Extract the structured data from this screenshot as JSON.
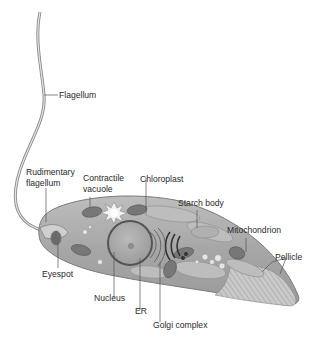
{
  "diagram": {
    "labels": {
      "flagellum": "Flagellum",
      "rudimentary_flagellum_1": "Rudimentary",
      "rudimentary_flagellum_2": "flagellum",
      "contractile_vacuole_1": "Contractile",
      "contractile_vacuole_2": "vacuole",
      "chloroplast": "Chloroplast",
      "starch_body": "Starch body",
      "mitochondrion": "Mitochondrion",
      "pellicle": "Pellicle",
      "eyespot": "Eyespot",
      "nucleus": "Nucleus",
      "er": "ER",
      "golgi_complex": "Golgi complex"
    },
    "colors": {
      "cell_fill": "#a9a9a9",
      "cell_light": "#c4c4c4",
      "organelle_dark": "#6e6e6e",
      "leader_line": "#555555",
      "text": "#2a2a2a"
    }
  }
}
